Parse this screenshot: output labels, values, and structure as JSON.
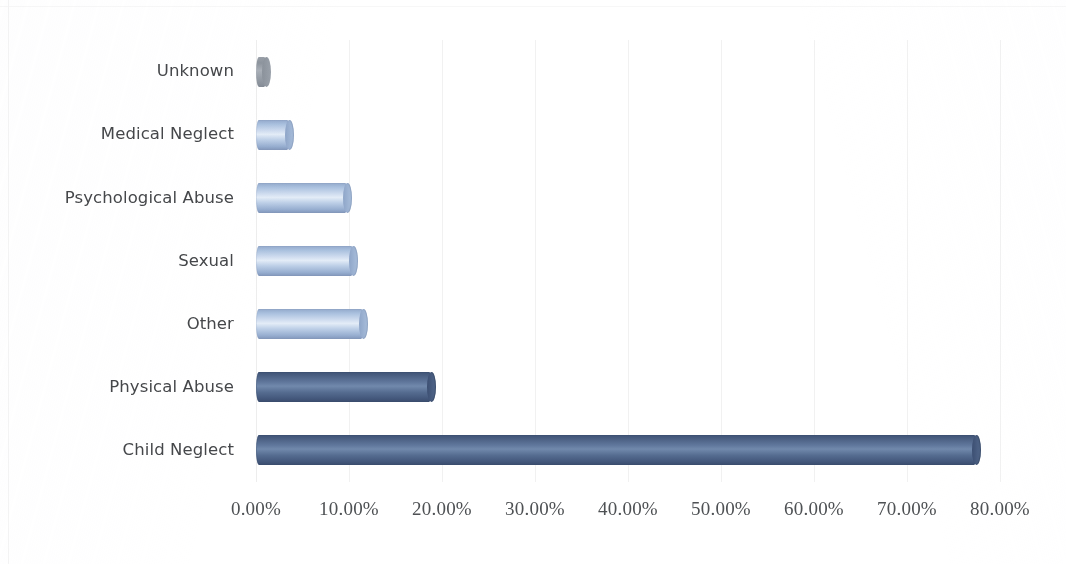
{
  "chart_data": {
    "type": "bar",
    "orientation": "horizontal",
    "title": "",
    "subtitle": "",
    "xlabel": "",
    "ylabel": "",
    "categories": [
      "Unknown",
      "Medical Neglect",
      "Psychological Abuse",
      "Sexual",
      "Other",
      "Physical Abuse",
      "Child Neglect"
    ],
    "values": [
      1.2,
      3.7,
      9.9,
      10.5,
      11.6,
      18.9,
      77.5
    ],
    "value_format": "percent",
    "xlim": [
      0,
      80
    ],
    "xticks": [
      0,
      10,
      20,
      30,
      40,
      50,
      60,
      70,
      80
    ],
    "xtick_labels": [
      "0.00%",
      "10.00%",
      "20.00%",
      "30.00%",
      "40.00%",
      "50.00%",
      "60.00%",
      "70.00%",
      "80.00%"
    ],
    "grid": true,
    "grid_axis": "x",
    "legend": false,
    "legend_position": "none",
    "bar_style": "3d-cylinder",
    "series": [
      {
        "name": "Percent of cases",
        "values": [
          1.2,
          3.7,
          9.9,
          10.5,
          11.6,
          18.9,
          77.5
        ]
      }
    ],
    "bar_tones": [
      "gray",
      "light",
      "light",
      "light",
      "light",
      "dark",
      "dark"
    ],
    "colors": {
      "bar_light": "#a8bedd",
      "bar_light_highlight": "#e3ecf7",
      "bar_dark": "#4a5f82",
      "bar_dark_highlight": "#7189ac",
      "bar_gray": "#9aa0a8",
      "gridline": "#f1f1f1",
      "axis_label_text": "#4e5154",
      "category_label_text": "#45474a",
      "background": "#ffffff"
    }
  }
}
